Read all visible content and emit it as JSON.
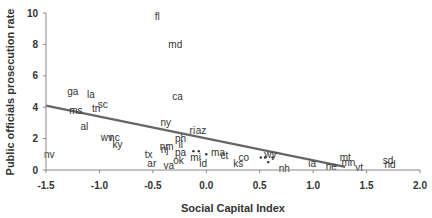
{
  "chart_data": {
    "type": "scatter",
    "title": "",
    "xlabel": "Social Capital Index",
    "ylabel": "Public officials prosecution rate",
    "xlim": [
      -1.5,
      2.0
    ],
    "ylim": [
      0,
      10
    ],
    "xticks": [
      -1.5,
      -1.0,
      -0.5,
      0.0,
      0.5,
      1.0,
      1.5,
      2.0
    ],
    "xtick_labels": [
      "-1.5",
      "-1.0",
      "-0.5",
      "0.0",
      "0.5",
      "1.0",
      "1.5",
      "2.0"
    ],
    "yticks": [
      0,
      2,
      4,
      6,
      8,
      10
    ],
    "ytick_labels": [
      "0",
      "2",
      "4",
      "6",
      "8",
      "10"
    ],
    "grid": false,
    "legend": null,
    "points": [
      {
        "label": "fl",
        "x": -0.46,
        "y": 9.75
      },
      {
        "label": "md",
        "x": -0.29,
        "y": 8.0
      },
      {
        "label": "ca",
        "x": -0.27,
        "y": 4.7
      },
      {
        "label": "ga",
        "x": -1.25,
        "y": 5.0
      },
      {
        "label": "la",
        "x": -1.08,
        "y": 4.8
      },
      {
        "label": "sc",
        "x": -0.97,
        "y": 4.2
      },
      {
        "label": "tn",
        "x": -1.03,
        "y": 3.9
      },
      {
        "label": "ms",
        "x": -1.22,
        "y": 3.8
      },
      {
        "label": "ny",
        "x": -0.38,
        "y": 3.0
      },
      {
        "label": "ri",
        "x": -0.13,
        "y": 2.5
      },
      {
        "label": "az",
        "x": -0.05,
        "y": 2.5
      },
      {
        "label": "al",
        "x": -1.14,
        "y": 2.8
      },
      {
        "label": "wv",
        "x": -0.93,
        "y": 2.1
      },
      {
        "label": "nc",
        "x": -0.86,
        "y": 2.1
      },
      {
        "label": "ky",
        "x": -0.83,
        "y": 1.6
      },
      {
        "label": "ph",
        "x": -0.24,
        "y": 2.0
      },
      {
        "label": "il",
        "x": -0.24,
        "y": 1.6
      },
      {
        "label": "nm",
        "x": -0.37,
        "y": 1.5
      },
      {
        "label": "nj",
        "x": -0.39,
        "y": 1.3
      },
      {
        "label": "pa",
        "x": -0.24,
        "y": 1.1
      },
      {
        "label": "tx",
        "x": -0.54,
        "y": 1.0
      },
      {
        "label": "nv",
        "x": -1.47,
        "y": 1.0
      },
      {
        "label": "mi",
        "x": -0.1,
        "y": 0.8
      },
      {
        "label": "ok",
        "x": -0.26,
        "y": 0.6
      },
      {
        "label": "ar",
        "x": -0.51,
        "y": 0.4
      },
      {
        "label": "va",
        "x": -0.35,
        "y": 0.3
      },
      {
        "label": "id",
        "x": -0.03,
        "y": 0.4
      },
      {
        "label": "ma",
        "x": 0.11,
        "y": 1.1
      },
      {
        "label": "ct",
        "x": 0.17,
        "y": 0.9
      },
      {
        "label": "co",
        "x": 0.35,
        "y": 0.8
      },
      {
        "label": "ks",
        "x": 0.3,
        "y": 0.4
      },
      {
        "label": "wy",
        "x": 0.6,
        "y": 1.0
      },
      {
        "label": "nh",
        "x": 0.73,
        "y": 0.1
      },
      {
        "label": "ia",
        "x": 0.99,
        "y": 0.4
      },
      {
        "label": "ne",
        "x": 1.17,
        "y": 0.2
      },
      {
        "label": "mt",
        "x": 1.3,
        "y": 0.8
      },
      {
        "label": "mn",
        "x": 1.33,
        "y": 0.5
      },
      {
        "label": "vt",
        "x": 1.43,
        "y": 0.15
      },
      {
        "label": "sd",
        "x": 1.7,
        "y": 0.6
      },
      {
        "label": "nd",
        "x": 1.72,
        "y": 0.35
      }
    ],
    "unlabeled_points": [
      {
        "x": -0.12,
        "y": 1.2
      },
      {
        "x": -0.07,
        "y": 1.2
      },
      {
        "x": 0.0,
        "y": 1.0
      },
      {
        "x": 0.51,
        "y": 0.8
      },
      {
        "x": 0.55,
        "y": 0.8
      },
      {
        "x": 0.58,
        "y": 0.5
      },
      {
        "x": 0.62,
        "y": 0.8
      }
    ],
    "trendline": {
      "type": "linear",
      "x0": -1.5,
      "y0": 4.1,
      "x1": 1.3,
      "y1": 0.2,
      "color": "#666666"
    }
  },
  "colors": {
    "axis": "#888888",
    "text": "#333333",
    "trendline": "#666666",
    "background": "#ffffff"
  }
}
